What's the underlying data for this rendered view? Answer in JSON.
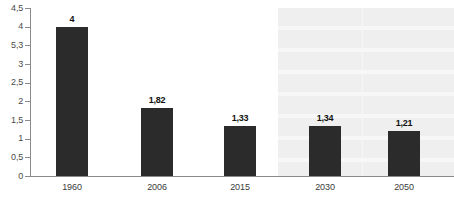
{
  "chart_data": {
    "type": "bar",
    "title": "",
    "subtitle": "",
    "xlabel": "",
    "ylabel": "",
    "categories": [
      "1960",
      "2006",
      "2015",
      "2030",
      "2050"
    ],
    "values": [
      4,
      1.82,
      1.33,
      1.34,
      1.21
    ],
    "value_labels": [
      "4",
      "1,82",
      "1,33",
      "1,34",
      "1,21"
    ],
    "ylim": [
      0,
      4.5
    ],
    "y_ticks": [
      0,
      0.5,
      1,
      1.5,
      2,
      2.5,
      3,
      3.5,
      4,
      4.5
    ],
    "y_tick_labels": [
      "0",
      "0,5",
      "1",
      "1,5",
      "2",
      "2,5",
      "3",
      "5,3",
      "4",
      "4,5"
    ],
    "grid": false,
    "legend": "none",
    "series": [
      {
        "name": "",
        "values": [
          4,
          1.82,
          1.33,
          1.34,
          1.21
        ]
      }
    ],
    "annotations": [
      {
        "type": "shaded-region",
        "label": "",
        "covers_categories": [
          "2030",
          "2050"
        ]
      }
    ],
    "colors": {
      "bar": "#2b2b2b",
      "axis": "#8a8a8a",
      "value_label": "#111111",
      "tick_label": "#4a4a4a",
      "forecast_band": "#efefef",
      "background": "#ffffff"
    }
  }
}
